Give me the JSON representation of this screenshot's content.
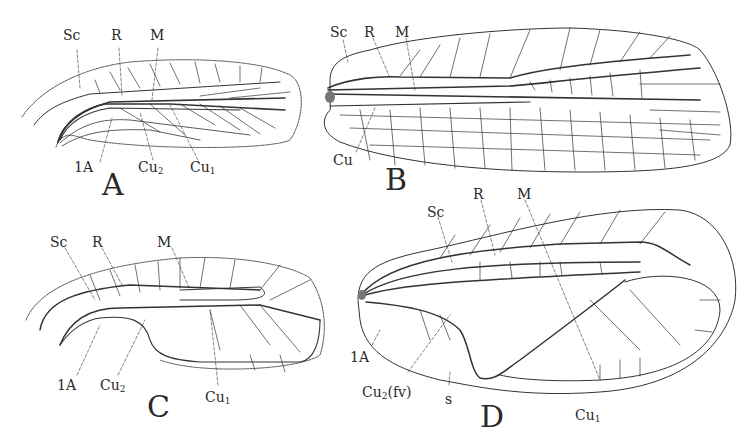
{
  "figure": {
    "panels": [
      {
        "id": "A",
        "label": "A",
        "vein_labels": {
          "top": [
            "Sc",
            "R",
            "M"
          ],
          "bottom": [
            "1A",
            "Cu2",
            "Cu1"
          ]
        }
      },
      {
        "id": "B",
        "label": "B",
        "vein_labels": {
          "top": [
            "Sc",
            "R",
            "M"
          ],
          "bottom": [
            "Cu"
          ]
        }
      },
      {
        "id": "C",
        "label": "C",
        "vein_labels": {
          "top": [
            "Sc",
            "R",
            "M"
          ],
          "bottom": [
            "1A",
            "Cu2",
            "Cu1"
          ]
        }
      },
      {
        "id": "D",
        "label": "D",
        "vein_labels": {
          "top": [
            "Sc",
            "R",
            "M"
          ],
          "bottom": [
            "1A",
            "Cu2(fv)",
            "s",
            "Cu1"
          ]
        }
      }
    ]
  },
  "labels": {
    "A": {
      "sc": "Sc",
      "r": "R",
      "m": "M",
      "a1": "1A",
      "cu2_base": "Cu",
      "cu2_sub": "2",
      "cu1_base": "Cu",
      "cu1_sub": "1",
      "panel": "A"
    },
    "B": {
      "sc": "Sc",
      "r": "R",
      "m": "M",
      "cu": "Cu",
      "panel": "B"
    },
    "C": {
      "sc": "Sc",
      "r": "R",
      "m": "M",
      "a1": "1A",
      "cu2_base": "Cu",
      "cu2_sub": "2",
      "cu1_base": "Cu",
      "cu1_sub": "1",
      "panel": "C"
    },
    "D": {
      "sc": "Sc",
      "r": "R",
      "m": "M",
      "a1": "1A",
      "cu2_base": "Cu",
      "cu2_sub": "2",
      "cu2_suffix": "(fv)",
      "s": "s",
      "cu1_base": "Cu",
      "cu1_sub": "1",
      "panel": "D"
    }
  },
  "colors": {
    "ink": "#2a2a2a",
    "background": "#ffffff"
  }
}
